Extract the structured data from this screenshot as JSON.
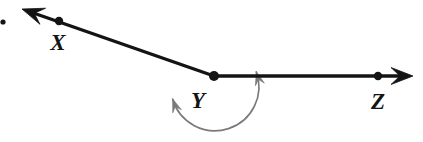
{
  "figure": {
    "kind": "geometry-diagram",
    "background_color": "#ffffff",
    "line_color": "#141414",
    "arc_color": "#7a7a7a",
    "label_color": "#141414"
  },
  "points": [
    {
      "id": "X",
      "label": "X",
      "cx": 59,
      "cy": 21,
      "r": 4.2,
      "label_x": 58,
      "label_y": 50
    },
    {
      "id": "Y",
      "label": "Y",
      "cx": 214,
      "cy": 76,
      "r": 5.0,
      "label_x": 198,
      "label_y": 108
    },
    {
      "id": "Z",
      "label": "Z",
      "cx": 378,
      "cy": 76,
      "r": 4.2,
      "label_x": 378,
      "label_y": 109
    }
  ],
  "rays": [
    {
      "id": "ray-YX",
      "name": "ray-y-to-x",
      "from": "Y",
      "through": "X",
      "start_x": 214,
      "start_y": 76,
      "end_x": 22,
      "end_y": 9,
      "arrow_at": "end",
      "stroke_width": 3.4
    },
    {
      "id": "ray-YZ",
      "name": "ray-y-to-z",
      "from": "Y",
      "through": "Z",
      "start_x": 214,
      "start_y": 76,
      "end_x": 413,
      "end_y": 76,
      "arrow_at": "end",
      "stroke_width": 3.4
    }
  ],
  "angle_arc": {
    "id": "reflex-angle-arc",
    "name": "reflex-angle-xyz",
    "center_x": 214,
    "center_y": 84,
    "radius": 44,
    "start_angle_deg": 16,
    "end_angle_deg": 200,
    "sweep": "reflex",
    "double_headed": true,
    "stroke_width": 1.7,
    "stroke_color": "#7a7a7a"
  },
  "stray_marks": [
    {
      "id": "speck",
      "cx": 3,
      "cy": 22,
      "r": 2.6
    }
  ],
  "labels": {
    "x_label": "X",
    "y_label": "Y",
    "z_label": "Z"
  }
}
